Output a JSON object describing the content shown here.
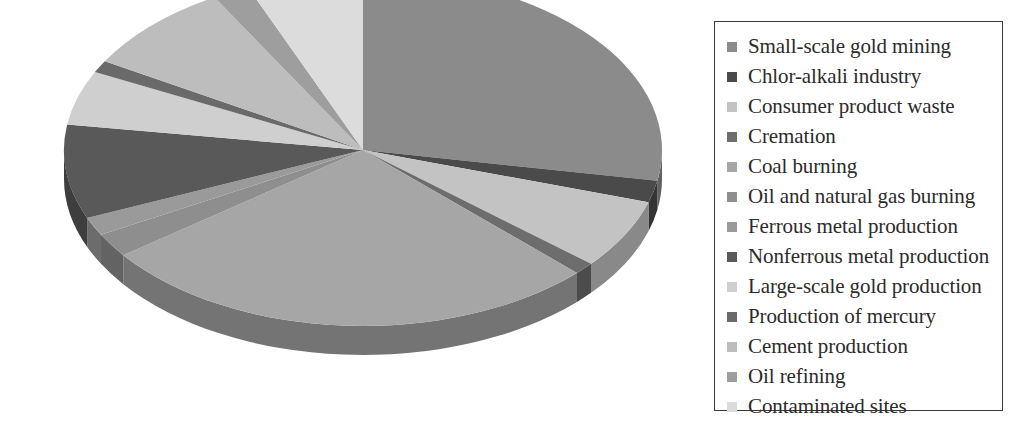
{
  "chart_data": {
    "type": "pie",
    "title": "",
    "subtitle": "",
    "three_d": true,
    "legend_position": "right",
    "grid": false,
    "units": "share of global anthropogenic mercury emissions",
    "categories": [
      "Small-scale gold mining",
      "Chlor-alkali industry",
      "Consumer product waste",
      "Cremation",
      "Coal burning",
      "Oil and natural gas burning",
      "Ferrous metal production",
      "Nonferrous metal production",
      "Large-scale gold production",
      "Production of mercury",
      "Cement production",
      "Oil refining",
      "Contaminated sites"
    ],
    "values": [
      27.8,
      2.0,
      6.4,
      1.1,
      27.5,
      2.2,
      1.7,
      8.6,
      5.0,
      1.1,
      8.3,
      2.0,
      6.3
    ],
    "colors": [
      "#8b8b8b",
      "#4a4a4a",
      "#c3c3c3",
      "#6d6d6d",
      "#a6a6a6",
      "#8e8e8e",
      "#9a9a9a",
      "#595959",
      "#cfcfcf",
      "#6a6a6a",
      "#bdbdbd",
      "#9e9e9e",
      "#dcdcdc"
    ],
    "slice_start_angles_deg": [
      0,
      100.1,
      107.3,
      130.3,
      134.3,
      233.3,
      241.2,
      247.3,
      278.3,
      296.3,
      300.3,
      330.2,
      337.4
    ],
    "slice_end_angles_deg": [
      100.1,
      107.3,
      130.3,
      134.3,
      233.3,
      241.2,
      247.3,
      278.3,
      296.3,
      300.3,
      330.2,
      337.4,
      360.0
    ],
    "xlabel": "",
    "ylabel": ""
  },
  "legend": {
    "items": [
      {
        "label": "Small-scale gold mining",
        "color": "#8b8b8b"
      },
      {
        "label": "Chlor-alkali industry",
        "color": "#4a4a4a"
      },
      {
        "label": "Consumer product waste",
        "color": "#c3c3c3"
      },
      {
        "label": "Cremation",
        "color": "#6d6d6d"
      },
      {
        "label": "Coal burning",
        "color": "#a6a6a6"
      },
      {
        "label": "Oil and natural gas burning",
        "color": "#8e8e8e"
      },
      {
        "label": "Ferrous metal production",
        "color": "#9a9a9a"
      },
      {
        "label": "Nonferrous metal production",
        "color": "#595959"
      },
      {
        "label": "Large-scale gold production",
        "color": "#cfcfcf"
      },
      {
        "label": "Production of mercury",
        "color": "#6a6a6a"
      },
      {
        "label": "Cement production",
        "color": "#bdbdbd"
      },
      {
        "label": "Oil refining",
        "color": "#9e9e9e"
      },
      {
        "label": "Contaminated sites",
        "color": "#dcdcdc"
      }
    ]
  },
  "style": {
    "background": "#ffffff",
    "legend_border": "#3a3a3a",
    "legend_text": "#2b2b2b"
  }
}
